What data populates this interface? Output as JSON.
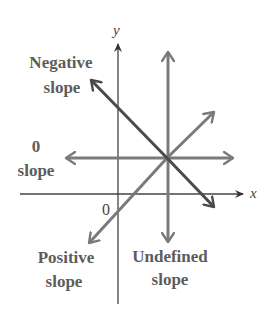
{
  "diagram": {
    "axes": {
      "x_label": "x",
      "y_label": "y",
      "origin_label": "0"
    },
    "labels": {
      "negative": {
        "line1": "Negative",
        "line2": "slope"
      },
      "zero": {
        "line1": "0",
        "line2": "slope"
      },
      "positive": {
        "line1": "Positive",
        "line2": "slope"
      },
      "undefined": {
        "line1": "Undefined",
        "line2": "slope"
      }
    },
    "lines": [
      {
        "name": "negative-slope",
        "from": [
          91,
          80
        ],
        "to": [
          214,
          207
        ],
        "color": "#4a4a4a"
      },
      {
        "name": "zero-slope",
        "from": [
          66,
          158
        ],
        "to": [
          233,
          158
        ],
        "color": "#7a7a7a"
      },
      {
        "name": "positive-slope",
        "from": [
          89,
          243
        ],
        "to": [
          214,
          112
        ],
        "color": "#7a7a7a"
      },
      {
        "name": "undefined-slope",
        "from": [
          168,
          242
        ],
        "to": [
          168,
          52
        ],
        "color": "#7a7a7a"
      }
    ],
    "colors": {
      "axis": "#444444",
      "dark_line": "#4a4a4a",
      "gray_line": "#7a7a7a",
      "text": "#5c5c5c"
    }
  }
}
